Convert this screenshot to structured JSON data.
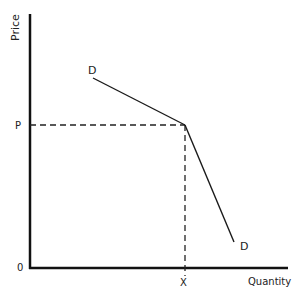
{
  "axes": {
    "y_label": "Price",
    "x_label": "Quantity",
    "origin_label": "0",
    "price_tick_label": "P",
    "quantity_tick_label": "X"
  },
  "curve": {
    "upper_label": "D",
    "lower_label": "D",
    "description": "Kinked demand curve"
  },
  "colors": {
    "axis": "#111111",
    "line": "#1a1a1a",
    "background": "#ffffff"
  }
}
